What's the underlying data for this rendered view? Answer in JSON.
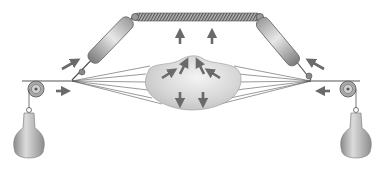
{
  "diagram": {
    "title": "",
    "labels": [],
    "colors": {
      "background": "#ffffff",
      "metal_light": "#d4d4d4",
      "metal_dark": "#6e6e6e",
      "arrow": "#6a6a6a",
      "string": "#555555",
      "membrane": "#d8d8d8"
    },
    "components": [
      {
        "name": "spring",
        "description": "horizontal coil spring at top"
      },
      {
        "name": "left-turnbuckle",
        "description": "diagonal tensioning rod on left"
      },
      {
        "name": "right-turnbuckle",
        "description": "diagonal tensioning rod on right"
      },
      {
        "name": "left-pulley",
        "description": "pulley wheel at left"
      },
      {
        "name": "right-pulley",
        "description": "pulley wheel at right"
      },
      {
        "name": "left-weight",
        "description": "hanging bottle-shaped weight on left"
      },
      {
        "name": "right-weight",
        "description": "hanging bottle-shaped weight on right"
      },
      {
        "name": "membrane",
        "description": "central deformed membrane blob with strings fanning out"
      },
      {
        "name": "force-arrows",
        "description": "arrows indicating force directions"
      }
    ]
  }
}
